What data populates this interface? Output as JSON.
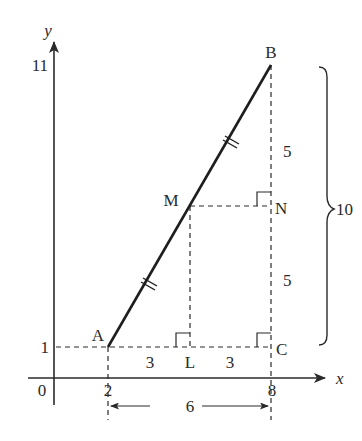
{
  "diagram": {
    "colors": {
      "ink": "#2a2a2a",
      "background": "#ffffff"
    },
    "axes": {
      "x_label": "x",
      "y_label": "y",
      "origin_label": "0",
      "x_ticks": [
        "2",
        "8"
      ],
      "y_ticks": [
        "1",
        "11"
      ]
    },
    "points": {
      "A": {
        "label": "A",
        "coords": [
          2,
          1
        ]
      },
      "B": {
        "label": "B",
        "coords": [
          8,
          11
        ]
      },
      "M": {
        "label": "M",
        "coords": [
          5,
          6
        ]
      },
      "L": {
        "label": "L",
        "coords": [
          5,
          1
        ]
      },
      "N": {
        "label": "N",
        "coords": [
          8,
          6
        ]
      },
      "C": {
        "label": "C",
        "coords": [
          8,
          1
        ]
      }
    },
    "measurements": {
      "AL": "3",
      "LC": "3",
      "BN": "5",
      "NC": "5",
      "BC_brace": "10",
      "horizontal_span": "6"
    },
    "annotations": {
      "equal_segment_marks": "double tick marks on AM and MB",
      "right_angles": [
        "L",
        "N",
        "C"
      ]
    }
  }
}
